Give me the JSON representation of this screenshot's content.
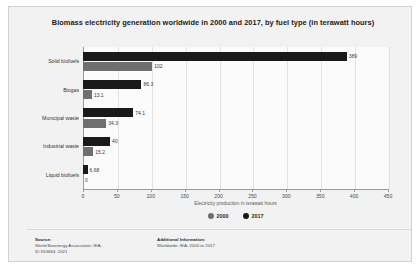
{
  "chart_data": {
    "type": "bar",
    "orientation": "horizontal",
    "title": "Biomass electricity generation worldwide in 2000 and 2017, by fuel type (in terawatt hours)",
    "xlabel": "Electricity production in terawatt hours",
    "ylabel": "",
    "xlim": [
      0,
      450
    ],
    "xticks": [
      0,
      50,
      100,
      150,
      200,
      250,
      300,
      350,
      400,
      450
    ],
    "xtick_labels": [
      "0",
      "50",
      "100",
      "150",
      "200",
      "250",
      "300",
      "350",
      "400",
      "450"
    ],
    "grid": true,
    "legend_position": "bottom",
    "categories": [
      "Solid biofuels",
      "Biogas",
      "Municipal waste",
      "Industrial waste",
      "Liquid biofuels"
    ],
    "series": [
      {
        "name": "2017",
        "color": "#1a1a1a",
        "values": [
          389,
          86.3,
          74.1,
          40,
          6.68
        ],
        "value_labels": [
          "389",
          "86.3",
          "74.1",
          "40",
          "6.68"
        ]
      },
      {
        "name": "2000",
        "color": "#6f6f6f",
        "values": [
          102,
          13.1,
          34.3,
          15.2,
          0
        ],
        "value_labels": [
          "102",
          "13.1",
          "34.3",
          "15.2",
          "0"
        ]
      }
    ]
  },
  "legend": {
    "items": [
      {
        "label": "2000",
        "color": "#6f6f6f"
      },
      {
        "label": "2017",
        "color": "#1a1a1a"
      }
    ]
  },
  "footer": {
    "source": {
      "heading": "Source:",
      "lines": [
        "World Bioenergy Association; IEA;",
        "ID 553664; 2021"
      ]
    },
    "additional": {
      "heading": "Additional Information:",
      "lines": [
        "Worldwide; IEA; 2000 to 2017"
      ]
    }
  }
}
